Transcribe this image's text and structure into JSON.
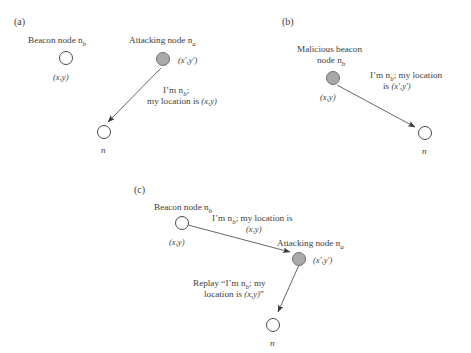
{
  "figure": {
    "title_implicit": "Location spoofing and replay attack scenarios",
    "colors": {
      "node_open_fill": "#ffffff",
      "node_open_stroke": "#4a4a4a",
      "node_filled_fill": "#a9a9a9",
      "node_filled_stroke": "#6e6e6e",
      "arrow": "#555555",
      "text": "#3d3d3d",
      "background": "#ffffff"
    }
  },
  "panels": {
    "a": {
      "tag": "(a)",
      "beacon_label": "Beacon node n",
      "beacon_sub": "b",
      "beacon_coord": "(x,y)",
      "attacker_label": "Attacking node n",
      "attacker_sub": "a",
      "attacker_coord": "(x′,y′)",
      "message_line1_pre": "I’m n",
      "message_line1_sub": "b",
      "message_line1_post": ";",
      "message_line2_pre": "my location is ",
      "message_line2_coord": "(x,y)",
      "target_label": "n"
    },
    "b": {
      "tag": "(b)",
      "beacon_label_line1": "Malicious beacon",
      "beacon_label_line2": "node n",
      "beacon_sub": "b",
      "beacon_coord": "(x,y)",
      "message_line1_pre": "I’m n",
      "message_line1_sub": "b",
      "message_line1_post": "; my location",
      "message_line2_pre": "is ",
      "message_line2_coord": "(x′,y′)",
      "target_label": "n"
    },
    "c": {
      "tag": "(c)",
      "beacon_label": "Beacon node n",
      "beacon_sub": "b",
      "beacon_coord": "(x,y)",
      "attacker_label": "Attacking node n",
      "attacker_sub": "a",
      "attacker_coord": "(x′,y′)",
      "message_line1_pre": "I’m n",
      "message_line1_sub": "b",
      "message_line1_post": "; my location is",
      "message_line2_coord": "(x,y)",
      "replay_line1_pre": "Replay “I’m n",
      "replay_line1_sub": "b",
      "replay_line1_post": "; my",
      "replay_line2_pre": "location is ",
      "replay_line2_coord": "(x,y)",
      "replay_line2_post": "”",
      "target_label": "n"
    }
  }
}
